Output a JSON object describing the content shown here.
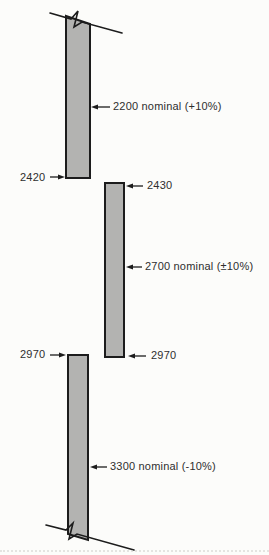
{
  "colors": {
    "background": "#fcfcfa",
    "bar_fill": "#b3b3b1",
    "line": "#1c1c1c",
    "text": "#2e2e2e",
    "artifact": "#c9c9c4"
  },
  "bars": {
    "top": {
      "nominal_label": "2200 nominal (+10%)",
      "bottom_label": "2420",
      "continues": "above (break symbol)"
    },
    "middle": {
      "top_label": "2430",
      "nominal_label": "2700 nominal (±10%)",
      "bottom_label": "2970"
    },
    "bottom": {
      "top_label": "2970",
      "nominal_label": "3300 nominal (-10%)",
      "continues": "below (break symbol)"
    }
  }
}
